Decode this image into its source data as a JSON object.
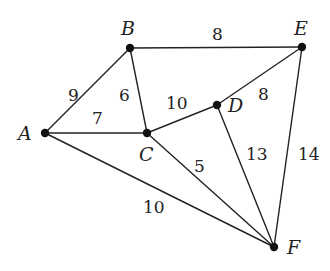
{
  "graph": {
    "nodes": [
      {
        "id": "A",
        "x": 45,
        "y": 133,
        "lx": 18,
        "ly": 140
      },
      {
        "id": "B",
        "x": 130,
        "y": 48,
        "lx": 121,
        "ly": 35
      },
      {
        "id": "C",
        "x": 147,
        "y": 133,
        "lx": 139,
        "ly": 161
      },
      {
        "id": "D",
        "x": 217,
        "y": 105,
        "lx": 228,
        "ly": 112
      },
      {
        "id": "E",
        "x": 302,
        "y": 47,
        "lx": 294,
        "ly": 35
      },
      {
        "id": "F",
        "x": 274,
        "y": 247,
        "lx": 287,
        "ly": 254
      }
    ],
    "edges": [
      {
        "from": "A",
        "to": "B",
        "weight": "9",
        "lx": 68,
        "ly": 101
      },
      {
        "from": "A",
        "to": "C",
        "weight": "7",
        "lx": 92,
        "ly": 124
      },
      {
        "from": "B",
        "to": "C",
        "weight": "6",
        "lx": 119,
        "ly": 101
      },
      {
        "from": "B",
        "to": "E",
        "weight": "8",
        "lx": 212,
        "ly": 40
      },
      {
        "from": "C",
        "to": "D",
        "weight": "10",
        "lx": 166,
        "ly": 109
      },
      {
        "from": "E",
        "to": "D",
        "weight": "8",
        "lx": 258,
        "ly": 100
      },
      {
        "from": "C",
        "to": "F",
        "weight": "5",
        "lx": 194,
        "ly": 172
      },
      {
        "from": "D",
        "to": "F",
        "weight": "13",
        "lx": 246,
        "ly": 160
      },
      {
        "from": "E",
        "to": "F",
        "weight": "14",
        "lx": 298,
        "ly": 160
      },
      {
        "from": "A",
        "to": "F",
        "weight": "10",
        "lx": 143,
        "ly": 213
      }
    ]
  }
}
